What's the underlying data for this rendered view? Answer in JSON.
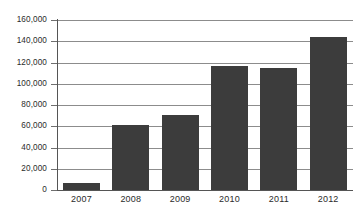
{
  "chart_data": {
    "type": "bar",
    "title": "",
    "subtitle": "",
    "xlabel": "",
    "ylabel": "",
    "categories": [
      "2007",
      "2008",
      "2009",
      "2010",
      "2011",
      "2012"
    ],
    "values": [
      7000,
      61000,
      71000,
      117000,
      115000,
      144000
    ],
    "series": [
      {
        "name": "",
        "values": [
          7000,
          61000,
          71000,
          117000,
          115000,
          144000
        ]
      }
    ],
    "ylim": [
      0,
      160000
    ],
    "ytick_values": [
      0,
      20000,
      40000,
      60000,
      80000,
      100000,
      120000,
      140000,
      160000
    ],
    "ytick_labels": [
      "0",
      "20,000",
      "40,000",
      "60,000",
      "80,000",
      "100,000",
      "120,000",
      "140,000",
      "160,000"
    ],
    "grid": true,
    "grid_axis": "y",
    "legend": false,
    "legend_position": "none",
    "bar_color": "#3c3c3c",
    "grid_color": "#8c8c8c",
    "axis_color": "#555555",
    "background_color": "#ffffff",
    "text_color": "#2b2b2b"
  }
}
